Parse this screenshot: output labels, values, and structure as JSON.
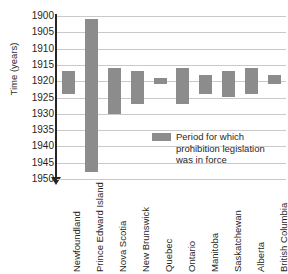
{
  "chart_data": {
    "type": "bar",
    "subtype": "floating-range-bar",
    "title": "",
    "xlabel": "",
    "ylabel": "Time (years)",
    "ylim": [
      1900,
      1950
    ],
    "y_inverted": true,
    "y_tick_step": 5,
    "grid": true,
    "legend_position": "inside-right",
    "bar_color": "#8c8c8c",
    "yticks": [
      "1900",
      "1905",
      "1910",
      "1915",
      "1920",
      "1925",
      "1930",
      "1935",
      "1940",
      "1945",
      "1950"
    ],
    "categories": [
      "Newfoundland",
      "Prince Edward Island",
      "Nova Scotia",
      "New Brunswick",
      "Quebec",
      "Ontario",
      "Manitoba",
      "Saskatchewan",
      "Alberta",
      "British Columbia"
    ],
    "series": [
      {
        "name": "Period for which prohibition legislation was in force",
        "start": [
          1917,
          1901,
          1916,
          1917,
          1919,
          1916,
          1918,
          1917,
          1916,
          1918
        ],
        "end": [
          1924,
          1948,
          1930,
          1927,
          1921,
          1927,
          1924,
          1925,
          1924,
          1921
        ]
      }
    ],
    "legend": [
      "Period for which prohibition legislation was in force"
    ]
  },
  "legend": {
    "line1": "Period for which",
    "line2": "prohibition legislation",
    "line3": "was in force"
  },
  "axis": {
    "y_title": "Time (years)"
  }
}
